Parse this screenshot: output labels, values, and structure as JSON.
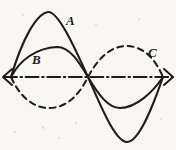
{
  "figure": {
    "background_color": "#f7f6f3",
    "ink_color": "#1c1c1c",
    "width": 176,
    "height": 150
  },
  "axis": {
    "name": "horizontal-axis",
    "style": "dash-dot chain line",
    "y": 77,
    "x_start": 2,
    "x_end": 176,
    "arrow_left": true,
    "arrow_right": true
  },
  "labels": [
    {
      "id": "A",
      "text": "A",
      "x": 66,
      "y": 25,
      "style": "italic"
    },
    {
      "id": "B",
      "text": "B",
      "x": 32,
      "y": 64,
      "style": "italic"
    },
    {
      "id": "C",
      "text": "C",
      "x": 148,
      "y": 57,
      "style": "italic"
    }
  ],
  "chart_data": {
    "type": "line",
    "xlabel": "",
    "ylabel": "",
    "grid": false,
    "legend": "inline curve labels A, B, C",
    "zero_crossings": [
      11,
      88,
      163
    ],
    "axis_y_pixel": 77,
    "series": [
      {
        "name": "A",
        "label": "A",
        "linestyle": "solid",
        "color": "#1c1c1c",
        "description": "Largest amplitude waveform: tall sharp positive crest in first half, deep negative trough in second half",
        "peak_x": 48,
        "peak_y": 12,
        "peak_amplitude": 65,
        "trough_x": 127,
        "trough_y": 142,
        "trough_amplitude": -65,
        "path": "M11,77 C22,40 36,14 48,12 C58,11 74,46 88,77 C100,104 115,142 127,142 C140,142 155,100 163,77"
      },
      {
        "name": "B",
        "label": "B",
        "linestyle": "solid",
        "color": "#1c1c1c",
        "description": "Smaller amplitude waveform: broad rounded positive hump in first half, shallower negative trough in second half",
        "peak_x": 57,
        "peak_y": 47,
        "peak_amplitude": 30,
        "trough_x": 120,
        "trough_y": 108,
        "trough_amplitude": -31,
        "path": "M11,77 C20,60 36,48 57,47 C70,47 79,62 88,77 C98,94 108,108 120,108 C136,108 153,92 163,77"
      },
      {
        "name": "C",
        "label": "C",
        "linestyle": "dashed",
        "color": "#1c1c1c",
        "description": "Dashed waveform in antiphase: negative lobe under the first half, positive lobe over the second half",
        "trough_x": 49,
        "trough_y": 108,
        "trough_amplitude": -31,
        "peak_x": 126,
        "peak_y": 46,
        "peak_amplitude": 31,
        "path": "M11,77 C19,95 32,108 49,108 C68,108 80,93 88,77 C97,60 110,46 126,46 C145,46 156,61 163,77"
      }
    ]
  }
}
